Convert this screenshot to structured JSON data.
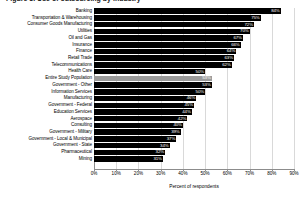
{
  "chart_data": {
    "type": "bar",
    "orientation": "horizontal",
    "title": "Figure 3. Use of outsourcing by industry",
    "xlabel": "Percent of respondents",
    "ylabel": "",
    "xlim": [
      0,
      90
    ],
    "xticks": [
      "0%",
      "10%",
      "20%",
      "30%",
      "40%",
      "50%",
      "60%",
      "70%",
      "80%",
      "90%"
    ],
    "xtick_values": [
      0,
      10,
      20,
      30,
      40,
      50,
      60,
      70,
      80,
      90
    ],
    "grid": true,
    "legend": "none",
    "categories": [
      "Banking",
      "Transportation & Warehousing",
      "Consumer Goods Manufacturing",
      "Utilities",
      "Oil and Gas",
      "Insurance",
      "Finance",
      "Retail Trade",
      "Telecommunications",
      "Health Care",
      "Entire Study Population",
      "Government - Other",
      "Information Services",
      "Manufacturing",
      "Government - Federal",
      "Education Services",
      "Aerospace",
      "Consulting",
      "Government - Military",
      "Government - Local & Municipal",
      "Government - State",
      "Pharmaceutical",
      "Mining"
    ],
    "values": [
      84,
      75,
      72,
      70,
      67,
      66,
      64,
      63,
      62,
      50,
      53,
      53,
      50,
      46,
      45,
      44,
      42,
      40,
      39,
      37,
      34,
      32,
      31
    ],
    "value_labels": [
      "84%",
      "75%",
      "72%",
      "70%",
      "67%",
      "66%",
      "64%",
      "63%",
      "62%",
      "50%",
      "53%",
      "53%",
      "50%",
      "46%",
      "45%",
      "44%",
      "42%",
      "40%",
      "39%",
      "37%",
      "34%",
      "32%",
      "31%"
    ],
    "highlight_category": "Entire Study Population",
    "colors": {
      "bar": "#000000",
      "highlight_bar": "#9b9b9b",
      "value_label": "#ffffff",
      "grid": "#d9d9d9",
      "axis": "#8c8c8c",
      "background": "#ffffff"
    }
  }
}
